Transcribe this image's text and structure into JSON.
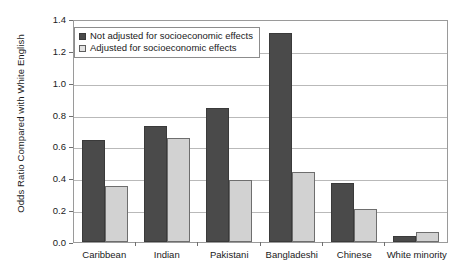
{
  "chart_data": {
    "type": "bar",
    "title": "",
    "xlabel": "",
    "ylabel": "Odds Ratio Compared with White English",
    "ylim": [
      0.0,
      1.4
    ],
    "yticks": [
      "1.4",
      "1.2",
      "1.0",
      "0.8",
      "0.6",
      "0.4",
      "0.2",
      "0.0"
    ],
    "ytick_values": [
      1.4,
      1.2,
      1.0,
      0.8,
      0.6,
      0.4,
      0.2,
      0.0
    ],
    "grid": true,
    "legend_position": "top-left",
    "categories": [
      "Caribbean",
      "Indian",
      "Pakistani",
      "Bangladeshi",
      "Chinese",
      "White minority"
    ],
    "series": [
      {
        "name": "Not adjusted for socioeconomic effects",
        "color": "#4a4a4a",
        "values": [
          0.64,
          0.73,
          0.84,
          1.31,
          0.37,
          0.04
        ]
      },
      {
        "name": "Adjusted for socioeconomic effects",
        "color": "#d2d2d2",
        "values": [
          0.35,
          0.65,
          0.39,
          0.44,
          0.21,
          0.06
        ]
      }
    ]
  },
  "legend": {
    "items": [
      {
        "label": "Not adjusted for socioeconomic effects",
        "swatch": "dark"
      },
      {
        "label": "Adjusted for socioeconomic effects",
        "swatch": "light"
      }
    ]
  }
}
